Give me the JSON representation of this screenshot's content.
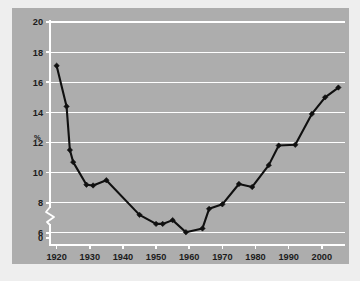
{
  "figure": {
    "background_color": "#eeeeee",
    "panel_color": "#adadad",
    "caption": ""
  },
  "chart_data": {
    "type": "line",
    "title": "",
    "subtitle": "",
    "xlabel": "",
    "ylabel": "%",
    "ylabel_text": "%",
    "xlim": [
      1918,
      2007
    ],
    "ylim": [
      5.2,
      20
    ],
    "y_axis_break": true,
    "y_break_between": [
      0,
      6
    ],
    "grid": true,
    "grid_color": "#ffffff",
    "grid_axis": "y",
    "legend": false,
    "legend_position": "none",
    "line_color": "#101010",
    "marker": "diamond",
    "marker_color": "#101010",
    "yticks": [
      0,
      6,
      8,
      10,
      12,
      14,
      16,
      18,
      20
    ],
    "ytick_labels": [
      "0",
      "6",
      "8",
      "10",
      "12",
      "14",
      "16",
      "18",
      "20"
    ],
    "xticks": [
      1920,
      1930,
      1940,
      1950,
      1960,
      1970,
      1980,
      1990,
      2000
    ],
    "xtick_labels": [
      "1920",
      "1930",
      "1940",
      "1950",
      "1960",
      "1970",
      "1980",
      "1990",
      "2000"
    ],
    "x": [
      1920,
      1923,
      1924,
      1925,
      1929,
      1931,
      1935,
      1945,
      1950,
      1952,
      1955,
      1959,
      1964,
      1966,
      1970,
      1975,
      1979,
      1984,
      1987,
      1992,
      1997,
      2001,
      2005
    ],
    "values": [
      17.1,
      14.4,
      11.5,
      10.7,
      9.2,
      9.15,
      9.5,
      7.2,
      6.6,
      6.6,
      6.85,
      6.05,
      6.3,
      7.6,
      7.9,
      9.25,
      9.05,
      10.5,
      11.8,
      11.85,
      13.9,
      15.0,
      15.65
    ],
    "series": [
      {
        "name": "share",
        "x": [
          1920,
          1923,
          1924,
          1925,
          1929,
          1931,
          1935,
          1945,
          1950,
          1952,
          1955,
          1959,
          1964,
          1966,
          1970,
          1975,
          1979,
          1984,
          1987,
          1992,
          1997,
          2001,
          2005
        ],
        "values": [
          17.1,
          14.4,
          11.5,
          10.7,
          9.2,
          9.15,
          9.5,
          7.2,
          6.6,
          6.6,
          6.85,
          6.05,
          6.3,
          7.6,
          7.9,
          9.25,
          9.05,
          10.5,
          11.8,
          11.85,
          13.9,
          15.0,
          15.65
        ]
      }
    ],
    "annotations": []
  }
}
